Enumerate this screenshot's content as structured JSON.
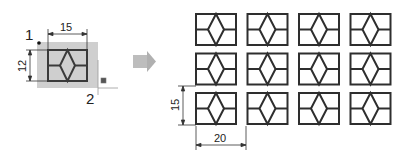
{
  "source": {
    "label_point1": "1",
    "label_point2": "2",
    "dim_width": "15",
    "dim_height": "12",
    "tile_fill": "#cfcfcf",
    "stroke": "#3a3a3a"
  },
  "arrow": {
    "icon": "right-arrow-icon",
    "color": "#b9b9b9"
  },
  "array": {
    "rows": 3,
    "cols": 4,
    "dim_row_spacing": "15",
    "dim_col_spacing": "20",
    "stroke": "#2e2e2e"
  }
}
